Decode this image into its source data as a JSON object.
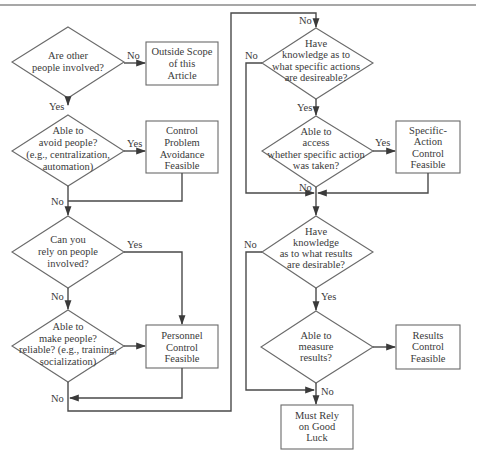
{
  "diagram": {
    "type": "flowchart",
    "nodes": {
      "q_other_people": {
        "kind": "decision",
        "lines": [
          "Are other",
          "people involved?"
        ]
      },
      "outside_scope": {
        "kind": "outcome",
        "lines": [
          "Outside Scope",
          "of this",
          "Article"
        ]
      },
      "q_avoid_people": {
        "kind": "decision",
        "lines": [
          "Able to",
          "avoid people?",
          "(e.g., centralization,",
          "automation)"
        ]
      },
      "control_problem_avoidance": {
        "kind": "outcome",
        "lines": [
          "Control",
          "Problem",
          "Avoidance",
          "Feasible"
        ]
      },
      "q_rely_on_people": {
        "kind": "decision",
        "lines": [
          "Can you",
          "rely on people",
          "involved?"
        ]
      },
      "q_make_reliable": {
        "kind": "decision",
        "lines": [
          "Able to",
          "make people?",
          "reliable? (e.g., training,",
          "socialization)"
        ]
      },
      "personnel_control": {
        "kind": "outcome",
        "lines": [
          "Personnel",
          "Control",
          "Feasible"
        ]
      },
      "q_specific_actions": {
        "kind": "decision",
        "lines": [
          "Have",
          "knowledge as to",
          "what specific actions",
          "are desireable?"
        ]
      },
      "q_access_action": {
        "kind": "decision",
        "lines": [
          "Able to",
          "access",
          "whether specific action",
          "was taken?"
        ]
      },
      "specific_action_control": {
        "kind": "outcome",
        "lines": [
          "Specific-",
          "Action",
          "Control",
          "Feasible"
        ]
      },
      "q_results_desirable": {
        "kind": "decision",
        "lines": [
          "Have",
          "knowledge",
          "as to what results",
          "are desirable?"
        ]
      },
      "q_measure_results": {
        "kind": "decision",
        "lines": [
          "Able to",
          "measure",
          "results?"
        ]
      },
      "results_control": {
        "kind": "outcome",
        "lines": [
          "Results",
          "Control",
          "Feasible"
        ]
      },
      "good_luck": {
        "kind": "outcome",
        "lines": [
          "Must Rely",
          "on Good",
          "Luck"
        ]
      }
    },
    "edge_labels": {
      "other_no": "No",
      "other_yes": "Yes",
      "avoid_yes": "Yes",
      "avoid_no": "No",
      "rely_yes": "Yes",
      "rely_no": "No",
      "reliable_no": "No",
      "spec_no_top": "No",
      "spec_no_left": "No",
      "spec_yes": "Yes",
      "access_yes": "Yes",
      "access_no": "No",
      "results_no": "No",
      "results_yes": "Yes",
      "measure_no": "No"
    },
    "edges": [
      {
        "from": "q_other_people",
        "to": "outside_scope",
        "label": "No"
      },
      {
        "from": "q_other_people",
        "to": "q_avoid_people",
        "label": "Yes"
      },
      {
        "from": "q_avoid_people",
        "to": "control_problem_avoidance",
        "label": "Yes"
      },
      {
        "from": "q_avoid_people",
        "to": "q_rely_on_people",
        "label": "No"
      },
      {
        "from": "control_problem_avoidance",
        "to": "q_rely_on_people",
        "label": ""
      },
      {
        "from": "q_rely_on_people",
        "to": "personnel_control",
        "label": "Yes"
      },
      {
        "from": "q_rely_on_people",
        "to": "q_make_reliable",
        "label": "No"
      },
      {
        "from": "q_make_reliable",
        "to": "personnel_control",
        "label": ""
      },
      {
        "from": "q_make_reliable",
        "to": "q_specific_actions",
        "label": "No"
      },
      {
        "from": "personnel_control",
        "to": "q_specific_actions",
        "label": ""
      },
      {
        "from": "q_specific_actions",
        "to": "q_access_action",
        "label": "Yes"
      },
      {
        "from": "q_specific_actions",
        "to": "q_results_desirable",
        "label": "No"
      },
      {
        "from": "q_access_action",
        "to": "specific_action_control",
        "label": "Yes"
      },
      {
        "from": "q_access_action",
        "to": "q_results_desirable",
        "label": "No"
      },
      {
        "from": "specific_action_control",
        "to": "q_results_desirable",
        "label": ""
      },
      {
        "from": "q_results_desirable",
        "to": "q_measure_results",
        "label": "Yes"
      },
      {
        "from": "q_results_desirable",
        "to": "good_luck",
        "label": "No"
      },
      {
        "from": "q_measure_results",
        "to": "results_control",
        "label": ""
      },
      {
        "from": "q_measure_results",
        "to": "good_luck",
        "label": "No"
      }
    ]
  }
}
